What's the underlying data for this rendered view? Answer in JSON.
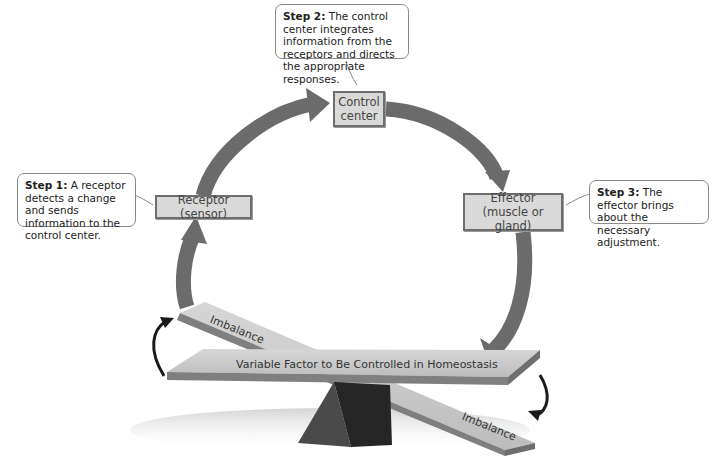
{
  "diagram": {
    "colors": {
      "arrow": "#6b6b6b",
      "box_fill": "#d9d9d9",
      "box_border": "#6e6e6e",
      "plank_top": "#cfcfcf",
      "plank_edge": "#7f7f7f",
      "pyramid": "#3a3a3a",
      "small_arrow": "#1a1a1a"
    },
    "steps": [
      {
        "label": "Step 1:",
        "text": " A receptor detects a change and sends information to the control center."
      },
      {
        "label": "Step 2:",
        "text": " The control center integrates information from the receptors and directs the appropriate responses."
      },
      {
        "label": "Step 3:",
        "text": " The effector brings about the necessary adjustment."
      }
    ],
    "nodes": {
      "receptor": "Receptor (sensor)",
      "control_center_line1": "Control",
      "control_center_line2": "center",
      "effector_line1": "Effector",
      "effector_line2": "(muscle or gland)"
    },
    "seesaw": {
      "main_label": "Variable Factor to Be Controlled in Homeostasis",
      "imbalance_top": "Imbalance",
      "imbalance_bottom": "Imbalance"
    }
  }
}
